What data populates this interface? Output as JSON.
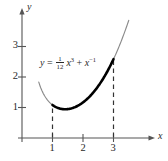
{
  "figure": {
    "type": "math-graph",
    "background": "#ffffff",
    "ink_color": "#2a2a2a",
    "curve_color": "#6e6e6e",
    "highlight_color": "#000000"
  },
  "axes": {
    "x_axis_label": "x",
    "y_axis_label": "y",
    "x_ticks": [
      "1",
      "2",
      "3"
    ],
    "y_ticks": [
      "1",
      "2",
      "3"
    ],
    "x_tick_values": [
      1,
      2,
      3
    ],
    "y_tick_values": [
      1,
      2,
      3
    ],
    "origin_px": {
      "x": 22,
      "y": 138
    },
    "unit_px": 30.5,
    "xlim": [
      -0.25,
      4.6
    ],
    "ylim": [
      -0.35,
      4.2
    ]
  },
  "equation": {
    "lhs": "y",
    "equals": "=",
    "coefficient_numerator": "1",
    "coefficient_denominator": "12",
    "term1_base": "x",
    "term1_exponent": "3",
    "plus": "+",
    "term2_base": "x",
    "term2_exponent": "−1",
    "plain": "y = (1/12)x^3 + x^-1"
  },
  "chart_data": {
    "type": "line",
    "title": "",
    "xlabel": "x",
    "ylabel": "y",
    "xlim": [
      -0.25,
      4.6
    ],
    "ylim": [
      -0.35,
      4.2
    ],
    "grid": false,
    "legend": "none",
    "xticks": [
      1,
      2,
      3
    ],
    "yticks": [
      1,
      2,
      3
    ],
    "annotations": [
      {
        "text": "y = (1/12)x^3 + x^-1",
        "x": 0.95,
        "y": 2.55
      }
    ],
    "series": [
      {
        "name": "y = (1/12)x^3 + x^-1 (full curve)",
        "style": "thin",
        "x": [
          0.55,
          0.65,
          0.75,
          0.85,
          0.95,
          1.0,
          1.2,
          1.4,
          1.6,
          1.8,
          2.0,
          2.2,
          2.4,
          2.6,
          2.8,
          3.0,
          3.2,
          3.4,
          3.5
        ],
        "y": [
          1.83,
          1.56,
          1.37,
          1.23,
          1.13,
          1.08,
          1.01,
          0.94,
          0.97,
          1.04,
          1.17,
          1.34,
          1.57,
          1.85,
          2.18,
          2.58,
          3.04,
          3.57,
          3.86
        ]
      },
      {
        "name": "highlighted arc 1 <= x <= 3",
        "style": "thick",
        "x": [
          1.0,
          1.2,
          1.4,
          1.6,
          1.8,
          2.0,
          2.2,
          2.4,
          2.6,
          2.8,
          3.0
        ],
        "y": [
          1.08,
          1.01,
          0.94,
          0.97,
          1.04,
          1.17,
          1.34,
          1.57,
          1.85,
          2.18,
          2.58
        ]
      }
    ],
    "dashed_verticals": [
      {
        "x": 1,
        "y_from": 0,
        "y_to": 1.08
      },
      {
        "x": 3,
        "y_from": 0,
        "y_to": 2.58
      }
    ]
  }
}
